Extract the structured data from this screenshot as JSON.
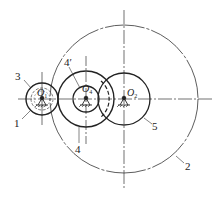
{
  "diagram": {
    "type": "gear-train-schematic",
    "colors": {
      "line": "#222222",
      "background": "#ffffff"
    },
    "centers": [
      {
        "id": "O1",
        "letter": "O",
        "sub": "1"
      },
      {
        "id": "O4",
        "letter": "O",
        "sub": "4"
      },
      {
        "id": "O2",
        "letter": "O",
        "sub": "2"
      }
    ],
    "labels": {
      "gear_1": "1",
      "gear_2": "2",
      "gear_3": "3",
      "gear_4": "4",
      "gear_4prime": "4′",
      "gear_5": "5"
    }
  }
}
